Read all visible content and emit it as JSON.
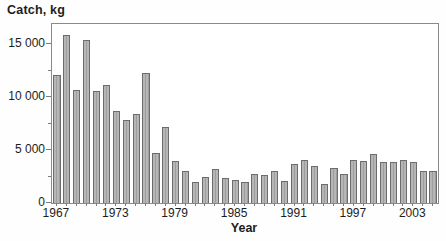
{
  "figure": {
    "width_px": 446,
    "height_px": 241,
    "background": "#fefefe"
  },
  "chart_data": {
    "type": "bar",
    "title": "Catch, kg",
    "xlabel": "Year",
    "ylabel": "Catch, kg",
    "x": [
      1967,
      1968,
      1969,
      1970,
      1971,
      1972,
      1973,
      1974,
      1975,
      1976,
      1977,
      1978,
      1979,
      1980,
      1981,
      1982,
      1983,
      1984,
      1985,
      1986,
      1987,
      1988,
      1989,
      1990,
      1991,
      1992,
      1993,
      1994,
      1995,
      1996,
      1997,
      1998,
      1999,
      2000,
      2001,
      2002,
      2003,
      2004,
      2005
    ],
    "values": [
      12100,
      15900,
      10700,
      15400,
      10600,
      11100,
      8700,
      7800,
      8400,
      12250,
      4700,
      7200,
      3950,
      3000,
      1950,
      2500,
      3200,
      2350,
      2150,
      1950,
      2700,
      2600,
      3000,
      2100,
      3700,
      4100,
      3450,
      1800,
      3350,
      2750,
      4100,
      3950,
      4650,
      3850,
      3850,
      4050,
      3850,
      3000,
      3000
    ],
    "ylim": [
      0,
      16900
    ],
    "ytick_values": [
      0,
      5000,
      10000,
      15000
    ],
    "ytick_labels": [
      "0",
      "5 000",
      "10 000",
      "15 000"
    ],
    "ytick_minor_values": [
      2500,
      7500,
      12500
    ],
    "xtick_years": [
      1967,
      1973,
      1979,
      1985,
      1991,
      1997,
      2003
    ],
    "xtick_labels": [
      "1967",
      "1973",
      "1979",
      "1985",
      "1991",
      "1997",
      "2003"
    ],
    "grid": false,
    "legend": "none",
    "bar_color": "#aaaaaa",
    "bar_edge_color": "#6c6c6c",
    "frame_color": "#8a8a8a",
    "text_color": "#1c1c1c"
  }
}
